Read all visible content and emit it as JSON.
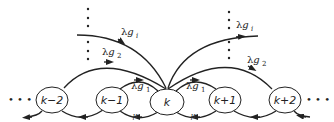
{
  "diagram": {
    "type": "state-transition",
    "nodes": [
      {
        "id": "km2",
        "label": "k−2"
      },
      {
        "id": "km1",
        "label": "k−1"
      },
      {
        "id": "k",
        "label": "k"
      },
      {
        "id": "kp1",
        "label": "k+1"
      },
      {
        "id": "kp2",
        "label": "k+2"
      }
    ],
    "ellipsis": {
      "left": "• • •",
      "right": "• • •"
    },
    "rates": {
      "lambda": "λ",
      "g": "g",
      "sub_1": "1",
      "sub_2": "2",
      "sub_i": "i",
      "mu": "μ"
    },
    "edges": [
      {
        "from": "k",
        "to": "kp1",
        "label": "λg1"
      },
      {
        "from": "k",
        "to": "kp2",
        "label": "λg2"
      },
      {
        "from": "k",
        "to": "k+i",
        "label": "λgi"
      },
      {
        "from": "km1",
        "to": "k",
        "label": "λg1"
      },
      {
        "from": "km2",
        "to": "k",
        "label": "λg2"
      },
      {
        "from": "k-i",
        "to": "k",
        "label": "λgi"
      },
      {
        "from": "k",
        "to": "km1",
        "label": "μ"
      },
      {
        "from": "kp1",
        "to": "k",
        "label": "μ"
      }
    ],
    "colors": {
      "stroke": "#222222",
      "background": "#ffffff"
    }
  }
}
